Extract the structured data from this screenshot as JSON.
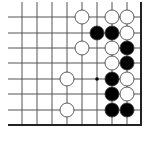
{
  "board": {
    "grid": {
      "columns_x": [
        22,
        37,
        52,
        67,
        82,
        97,
        112,
        127
      ],
      "rows_y": [
        17,
        33,
        48,
        63,
        79,
        94,
        110
      ],
      "right_edge_x": 141,
      "bottom_edge_y": 125,
      "top_open_y": 2,
      "left_open_x": 8,
      "line_color": "#555555",
      "edge_color": "#222222"
    },
    "stone_radius": 7,
    "colors": {
      "black": "#000000",
      "white": "#ffffff",
      "outline": "#333333"
    },
    "stones": [
      {
        "color": "white",
        "col": 4,
        "row": 0
      },
      {
        "color": "white",
        "col": 6,
        "row": 0
      },
      {
        "color": "white",
        "col": 7,
        "row": 0
      },
      {
        "color": "black",
        "col": 5,
        "row": 1
      },
      {
        "color": "black",
        "col": 6,
        "row": 1
      },
      {
        "color": "white",
        "col": 7,
        "row": 1
      },
      {
        "color": "white",
        "col": 4,
        "row": 2
      },
      {
        "color": "white",
        "col": 6,
        "row": 2
      },
      {
        "color": "black",
        "col": 7,
        "row": 2
      },
      {
        "color": "white",
        "col": 6,
        "row": 3
      },
      {
        "color": "black",
        "col": 7,
        "row": 3
      },
      {
        "color": "white",
        "col": 3,
        "row": 4
      },
      {
        "color": "black",
        "col": 6,
        "row": 4
      },
      {
        "color": "white",
        "col": 7,
        "row": 4
      },
      {
        "color": "black",
        "col": 6,
        "row": 5
      },
      {
        "color": "white",
        "col": 7,
        "row": 5
      },
      {
        "color": "white",
        "col": 3,
        "row": 6
      },
      {
        "color": "black",
        "col": 6,
        "row": 6
      },
      {
        "color": "black",
        "col": 7,
        "row": 6
      }
    ],
    "markers": [
      {
        "type": "dot",
        "col": 5,
        "row": 4
      }
    ]
  }
}
